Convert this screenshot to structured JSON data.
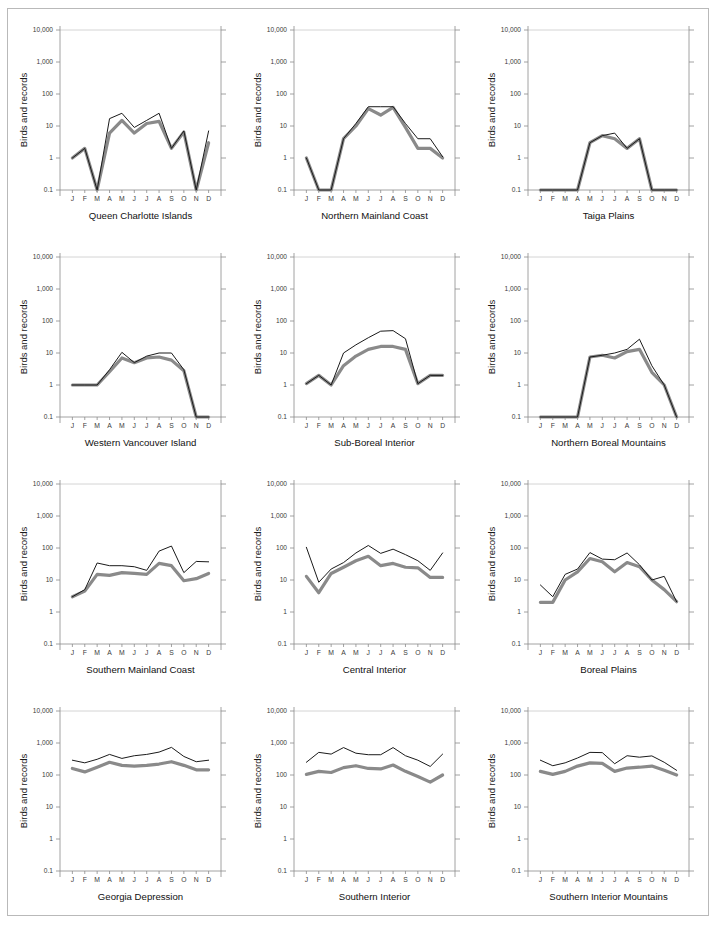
{
  "figure": {
    "ylabel": "Birds and records",
    "months": [
      "J",
      "F",
      "M",
      "A",
      "M",
      "J",
      "J",
      "A",
      "S",
      "O",
      "N",
      "D"
    ],
    "ytick_labels": [
      "10,000",
      "1,000",
      "100",
      "10",
      "1",
      "0.1"
    ],
    "ytick_values": [
      10000,
      1000,
      100,
      10,
      1,
      0.1
    ],
    "colors": {
      "records_line": "#1a1a1a",
      "birds_line": "#8a8a8a",
      "axis": "#8c8c8c",
      "grid": "#c9c9c9",
      "background": "#ffffff"
    }
  },
  "chart_data": {
    "type": "line",
    "title": "",
    "xlabel": "",
    "ylabel": "Birds and records",
    "x": [
      "J",
      "F",
      "M",
      "A",
      "M",
      "J",
      "J",
      "A",
      "S",
      "O",
      "N",
      "D"
    ],
    "yscale": "log",
    "ylim": [
      0.1,
      10000
    ],
    "grid": "top-gridline-only",
    "legend": "none",
    "series_names": [
      "records",
      "birds"
    ],
    "panels": [
      {
        "title": "Queen Charlotte Islands",
        "series": [
          {
            "name": "records",
            "values": [
              1.0,
              2.0,
              0.1,
              17,
              25,
              9,
              15,
              25,
              2.0,
              7.0,
              0.1,
              7.0
            ]
          },
          {
            "name": "birds",
            "values": [
              1.0,
              2.0,
              0.1,
              6.0,
              15,
              6.0,
              12,
              14,
              2.0,
              6.5,
              0.1,
              3.0
            ]
          }
        ]
      },
      {
        "title": "Northern Mainland Coast",
        "series": [
          {
            "name": "records",
            "values": [
              1.0,
              0.1,
              0.1,
              4.0,
              12,
              40,
              40,
              40,
              12,
              4.0,
              4.0,
              1.1
            ]
          },
          {
            "name": "birds",
            "values": [
              1.0,
              0.1,
              0.1,
              4.0,
              10,
              35,
              22,
              38,
              9.0,
              2.0,
              2.0,
              1.0
            ]
          }
        ]
      },
      {
        "title": "Taiga Plains",
        "series": [
          {
            "name": "records",
            "values": [
              0.1,
              0.1,
              0.1,
              0.1,
              3.0,
              5.0,
              6.0,
              2.0,
              4.0,
              0.1,
              0.1,
              0.1
            ]
          },
          {
            "name": "birds",
            "values": [
              0.1,
              0.1,
              0.1,
              0.1,
              3.0,
              5.0,
              4.0,
              2.0,
              4.0,
              0.1,
              0.1,
              0.1
            ]
          }
        ]
      },
      {
        "title": "Western Vancouver Island",
        "series": [
          {
            "name": "records",
            "values": [
              1.0,
              1.0,
              1.0,
              3.0,
              10.5,
              5.0,
              8.0,
              10,
              10,
              3.0,
              0.1,
              0.1,
              1.0
            ]
          },
          {
            "name": "birds",
            "values": [
              1.0,
              1.0,
              1.0,
              2.6,
              7.0,
              5.0,
              7.0,
              7.5,
              6.0,
              2.8,
              0.1,
              0.1,
              1.0
            ]
          }
        ]
      },
      {
        "title": "Sub-Boreal Interior",
        "series": [
          {
            "name": "records",
            "values": [
              1.1,
              2.0,
              1.0,
              10,
              18,
              30,
              48,
              50,
              28,
              1.1,
              2.0,
              2.0,
              1.0
            ]
          },
          {
            "name": "birds",
            "values": [
              1.1,
              2.0,
              1.0,
              4.0,
              8.0,
              13,
              16,
              16,
              13,
              1.1,
              2.0,
              2.0,
              1.0
            ]
          }
        ]
      },
      {
        "title": "Northern Boreal Mountains",
        "series": [
          {
            "name": "records",
            "values": [
              0.1,
              0.1,
              0.1,
              0.1,
              7.5,
              8.5,
              10,
              13,
              27,
              4.0,
              1.0,
              0.1,
              0.1
            ]
          },
          {
            "name": "birds",
            "values": [
              0.1,
              0.1,
              0.1,
              0.1,
              7.5,
              8.5,
              7.0,
              11,
              13,
              2.5,
              1.0,
              0.1,
              0.1
            ]
          }
        ]
      },
      {
        "title": "Southern Mainland Coast",
        "series": [
          {
            "name": "records",
            "values": [
              3.0,
              5.0,
              34,
              28,
              28,
              26,
              20,
              80,
              115,
              17,
              38,
              37
            ]
          },
          {
            "name": "birds",
            "values": [
              3.0,
              4.5,
              15,
              14,
              17,
              16,
              15,
              33,
              28,
              9.5,
              11,
              16
            ]
          }
        ]
      },
      {
        "title": "Central Interior",
        "series": [
          {
            "name": "records",
            "values": [
              105,
              8.5,
              22,
              35,
              70,
              120,
              68,
              92,
              62,
              40,
              20,
              70
            ]
          },
          {
            "name": "birds",
            "values": [
              13,
              4.0,
              16,
              25,
              40,
              55,
              28,
              33,
              25,
              24,
              12,
              12
            ]
          }
        ]
      },
      {
        "title": "Boreal Plains",
        "series": [
          {
            "name": "records",
            "values": [
              7.0,
              3.0,
              15,
              22,
              72,
              45,
              43,
              70,
              30,
              10,
              13,
              2.1
            ]
          },
          {
            "name": "birds",
            "values": [
              2.0,
              2.0,
              10,
              18,
              47,
              37,
              18,
              35,
              26,
              10,
              5.0,
              2.1
            ]
          }
        ]
      },
      {
        "title": "Georgia Depression",
        "series": [
          {
            "name": "records",
            "values": [
              290,
              240,
              310,
              440,
              330,
              400,
              440,
              520,
              730,
              380,
              260,
              290
            ]
          },
          {
            "name": "birds",
            "values": [
              160,
              125,
              175,
              250,
              200,
              190,
              200,
              220,
              260,
              200,
              145,
              145
            ]
          }
        ]
      },
      {
        "title": "Southern Interior",
        "series": [
          {
            "name": "records",
            "values": [
              250,
              510,
              450,
              720,
              480,
              430,
              430,
              720,
              400,
              290,
              185,
              450
            ]
          },
          {
            "name": "birds",
            "values": [
              105,
              130,
              120,
              170,
              195,
              160,
              155,
              205,
              130,
              90,
              60,
              100
            ]
          }
        ]
      },
      {
        "title": "Southern Interior Mountains",
        "series": [
          {
            "name": "records",
            "values": [
              290,
              195,
              240,
              340,
              510,
              500,
              225,
              400,
              360,
              395,
              250,
              140
            ]
          },
          {
            "name": "birds",
            "values": [
              130,
              105,
              130,
              190,
              240,
              230,
              130,
              165,
              175,
              190,
              140,
              100
            ]
          }
        ]
      }
    ]
  }
}
